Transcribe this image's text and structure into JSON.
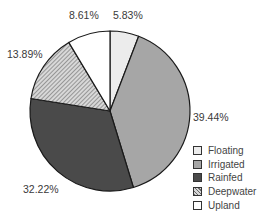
{
  "chart_data": {
    "type": "pie",
    "title": "",
    "categories": [
      "Floating",
      "Irrigated",
      "Rainfed",
      "Deepwater",
      "Upland"
    ],
    "values": [
      5.83,
      39.44,
      32.22,
      13.89,
      8.61
    ],
    "labels": [
      "5.83%",
      "39.44%",
      "32.22%",
      "13.89%",
      "8.61%"
    ],
    "start_angle": "12 o'clock",
    "direction": "clockwise",
    "legend_position": "bottom-right",
    "colors": [
      "#ececec",
      "#a6a6a6",
      "#4a4a4a",
      "hatched",
      "#ffffff"
    ]
  },
  "legend": {
    "items": [
      {
        "label": "Floating",
        "fill": "#ececec"
      },
      {
        "label": "Irrigated",
        "fill": "#a6a6a6"
      },
      {
        "label": "Rainfed",
        "fill": "#4a4a4a"
      },
      {
        "label": "Deepwater",
        "fill": "hatch"
      },
      {
        "label": "Upland",
        "fill": "#ffffff"
      }
    ]
  },
  "slice_labels": {
    "floating": "5.83%",
    "irrigated": "39.44%",
    "rainfed": "32.22%",
    "deepwater": "13.89%",
    "upland": "8.61%"
  }
}
